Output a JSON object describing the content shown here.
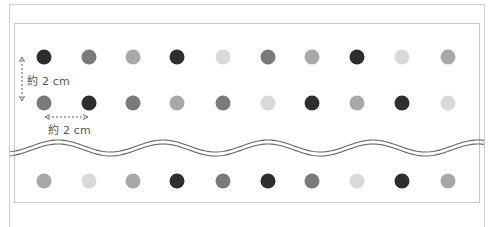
{
  "colors": {
    "dark": "#2e2e2e",
    "mid": "#7a7a7a",
    "light": "#a8a8a8",
    "pale": "#d9d9d9",
    "wave": "#666666",
    "frame": "#c8c8c8",
    "arrow": "#666666",
    "text": "#555555"
  },
  "columns_x": [
    44,
    89,
    133,
    177,
    223,
    268,
    312,
    357,
    402,
    448
  ],
  "rows": [
    {
      "y": 57,
      "tones": [
        "dark",
        "mid",
        "light",
        "dark",
        "pale",
        "mid",
        "light",
        "dark",
        "pale",
        "light"
      ]
    },
    {
      "y": 103,
      "tones": [
        "mid",
        "dark",
        "mid",
        "light",
        "mid",
        "pale",
        "dark",
        "light",
        "dark",
        "pale"
      ]
    },
    {
      "y": 181,
      "tones": [
        "light",
        "pale",
        "light",
        "dark",
        "mid",
        "dark",
        "mid",
        "pale",
        "dark",
        "light"
      ]
    }
  ],
  "annotations": {
    "vertical_spacing": "約 2 cm",
    "horizontal_spacing": "約 2 cm"
  },
  "break_line": {
    "style": "double-wave",
    "baseline_y": 148,
    "amplitude": 6,
    "period": 105
  }
}
